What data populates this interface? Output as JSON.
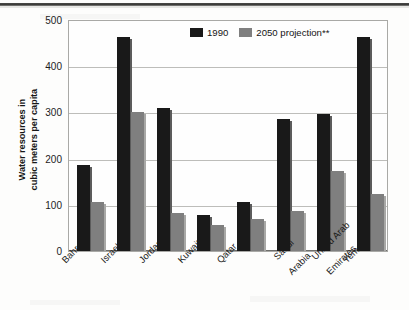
{
  "chart_data": {
    "type": "bar",
    "title": "",
    "subtitle": "",
    "xlabel": "",
    "ylabel": "Water resources in\ncubic meters per capita",
    "ylabel_line1": "Water resources in",
    "ylabel_line2": "cubic meters per capita",
    "categories": [
      "Bahrain",
      "Israel",
      "Jordan",
      "Kuwait",
      "Qatar",
      "Saudi\nArabia",
      "United Arab\nEmirates",
      "Yemen"
    ],
    "category_labels_flat": [
      "Bahrain",
      "Israel",
      "Jordan",
      "Kuwait",
      "Qatar",
      "Saudi Arabia",
      "United Arab Emirates",
      "Yemen"
    ],
    "series": [
      {
        "name": "1990",
        "color": "#191919",
        "values": [
          185,
          462,
          308,
          78,
          105,
          285,
          295,
          462
        ]
      },
      {
        "name": "2050 projection**",
        "color": "#7f7f7f",
        "values": [
          105,
          300,
          82,
          55,
          70,
          87,
          172,
          122
        ]
      }
    ],
    "ylim": [
      0,
      500
    ],
    "yticks": [
      0,
      100,
      200,
      300,
      400,
      500
    ],
    "ytick_labels": [
      "0",
      "100",
      "200",
      "300",
      "400",
      "500"
    ],
    "grid": true,
    "grid_axis": "y",
    "legend_position": "top-center",
    "bar_orientation": "vertical"
  },
  "legend": {
    "items": [
      {
        "label": "1990",
        "color": "#191919"
      },
      {
        "label": "2050 projection**",
        "color": "#7f7f7f"
      }
    ]
  },
  "axes": {
    "y_title_line1": "Water resources in",
    "y_title_line2": "cubic meters per capita",
    "y_tick_0": "0",
    "y_tick_1": "100",
    "y_tick_2": "200",
    "y_tick_3": "300",
    "y_tick_4": "400",
    "y_tick_5": "500"
  },
  "x_labels": {
    "bahrain": "Bahrain",
    "israel": "Israel",
    "jordan": "Jordan",
    "kuwait": "Kuwait",
    "qatar": "Qatar",
    "saudi_l1": "Saudi",
    "saudi_l2": "Arabia",
    "uae_l1": "United Arab",
    "uae_l2": "Emirates",
    "yemen": "Yemen"
  },
  "colors": {
    "series_1990": "#191919",
    "series_2050": "#7f7f7f",
    "grid": "#bdbdba",
    "frame": "#a9a9a6",
    "background": "#fdfdfc"
  }
}
